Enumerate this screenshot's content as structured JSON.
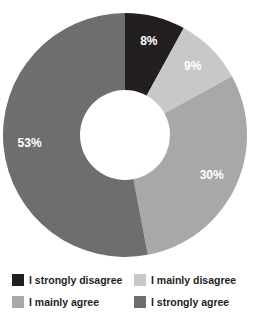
{
  "chart_data": {
    "type": "pie",
    "variant": "donut",
    "title": "",
    "xlabel": "",
    "ylabel": "",
    "start_angle_deg": 0,
    "direction": "clockwise",
    "inner_radius_ratio": 0.37,
    "legend_position": "bottom",
    "grid": false,
    "categories": [
      "I strongly disagree",
      "I mainly disagree",
      "I mainly agree",
      "I strongly agree"
    ],
    "values": [
      8,
      9,
      30,
      53
    ],
    "value_labels": [
      "8%",
      "9%",
      "30%",
      "53%"
    ],
    "colors": [
      "#231f20",
      "#c8c8c8",
      "#a8a8a8",
      "#6e6e6e"
    ],
    "slices": [
      {
        "label": "I strongly disagree",
        "value": 8,
        "value_label": "8%",
        "color": "#231f20",
        "label_color": "#ffffff"
      },
      {
        "label": "I mainly disagree",
        "value": 9,
        "value_label": "9%",
        "color": "#c8c8c8",
        "label_color": "#ffffff"
      },
      {
        "label": "I mainly agree",
        "value": 30,
        "value_label": "30%",
        "color": "#a8a8a8",
        "label_color": "#ffffff"
      },
      {
        "label": "I strongly agree",
        "value": 53,
        "value_label": "53%",
        "color": "#6e6e6e",
        "label_color": "#ffffff"
      }
    ]
  },
  "legend": {
    "items": [
      {
        "label": "I strongly disagree",
        "color": "#231f20"
      },
      {
        "label": "I mainly disagree",
        "color": "#c8c8c8"
      },
      {
        "label": "I mainly agree",
        "color": "#a8a8a8"
      },
      {
        "label": "I strongly agree",
        "color": "#6e6e6e"
      }
    ]
  },
  "colors": {
    "background": "#ffffff",
    "hole": "#ffffff",
    "text": "#231f20",
    "slice_label": "#ffffff"
  }
}
